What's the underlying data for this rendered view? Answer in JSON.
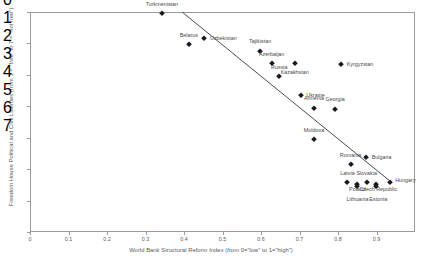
{
  "chart_data": {
    "type": "scatter",
    "title": "",
    "xlabel": "World Bank Structural Reform Index (from 0=\"low\" to 1=\"high\")",
    "ylabel": "Freedom House Political and Civil Liberties (from 1 = \"free\" to 7 = \"not free\")",
    "xlim": [
      0,
      1
    ],
    "ylim": [
      0,
      7
    ],
    "y_inverted": false,
    "grid": false,
    "legend": null,
    "xticks": [
      "0",
      "0.1",
      "0.2",
      "0.3",
      "0.4",
      "0.5",
      "0.6",
      "0.7",
      "0.8",
      "0.9"
    ],
    "yticks": [
      "0",
      "1",
      "2",
      "3",
      "4",
      "5",
      "6",
      "7"
    ],
    "points": [
      {
        "label": "Turkmenistan",
        "x": 0.34,
        "y": 7.0,
        "lx": 0.34,
        "ly": 7.3,
        "anchor": "mid"
      },
      {
        "label": "Uzbekistan",
        "x": 0.45,
        "y": 6.2,
        "lx": 0.465,
        "ly": 6.2,
        "anchor": "rgt"
      },
      {
        "label": "Belarus",
        "x": 0.41,
        "y": 6.0,
        "lx": 0.41,
        "ly": 6.3,
        "anchor": "mid"
      },
      {
        "label": "Tajikistan",
        "x": 0.595,
        "y": 5.8,
        "lx": 0.595,
        "ly": 6.1,
        "anchor": "mid"
      },
      {
        "label": "Azerbaijan",
        "x": 0.625,
        "y": 5.4,
        "lx": 0.625,
        "ly": 5.7,
        "anchor": "mid"
      },
      {
        "label": "Kazakhstan",
        "x": 0.685,
        "y": 5.4,
        "lx": 0.685,
        "ly": 5.12,
        "anchor": "mid"
      },
      {
        "label": "Kyrgyzstan",
        "x": 0.805,
        "y": 5.38,
        "lx": 0.82,
        "ly": 5.38,
        "anchor": "rgt"
      },
      {
        "label": "Russia",
        "x": 0.645,
        "y": 4.98,
        "lx": 0.645,
        "ly": 5.28,
        "anchor": "mid"
      },
      {
        "label": "Ukraine",
        "x": 0.7,
        "y": 4.4,
        "lx": 0.715,
        "ly": 4.4,
        "anchor": "rgt"
      },
      {
        "label": "Armenia",
        "x": 0.735,
        "y": 3.98,
        "lx": 0.735,
        "ly": 4.28,
        "anchor": "mid"
      },
      {
        "label": "Georgia",
        "x": 0.79,
        "y": 3.96,
        "lx": 0.79,
        "ly": 4.26,
        "anchor": "mid"
      },
      {
        "label": "Moldova",
        "x": 0.735,
        "y": 2.98,
        "lx": 0.735,
        "ly": 3.28,
        "anchor": "mid"
      },
      {
        "label": "Bulgaria",
        "x": 0.87,
        "y": 2.42,
        "lx": 0.885,
        "ly": 2.42,
        "anchor": "rgt"
      },
      {
        "label": "Romania",
        "x": 0.83,
        "y": 2.18,
        "lx": 0.83,
        "ly": 2.48,
        "anchor": "mid"
      },
      {
        "label": "Latvia",
        "x": 0.822,
        "y": 1.62,
        "lx": 0.822,
        "ly": 1.92,
        "anchor": "mid"
      },
      {
        "label": "Slovakia",
        "x": 0.872,
        "y": 1.62,
        "lx": 0.872,
        "ly": 1.92,
        "anchor": "mid"
      },
      {
        "label": "Hungary",
        "x": 0.932,
        "y": 1.62,
        "lx": 0.946,
        "ly": 1.7,
        "anchor": "rgt"
      },
      {
        "label": "Poland",
        "x": 0.848,
        "y": 1.55,
        "lx": 0.848,
        "ly": 1.4,
        "anchor": "mid"
      },
      {
        "label": "Czech Republic",
        "x": 0.896,
        "y": 1.55,
        "lx": 0.902,
        "ly": 1.4,
        "anchor": "mid"
      },
      {
        "label": "Lithuania",
        "x": 0.848,
        "y": 1.5,
        "lx": 0.848,
        "ly": 1.08,
        "anchor": "mid"
      },
      {
        "label": "Estonia",
        "x": 0.896,
        "y": 1.5,
        "lx": 0.902,
        "ly": 1.08,
        "anchor": "mid"
      }
    ],
    "trendline": {
      "x0": 0.395,
      "y0": 7.0,
      "x1": 0.935,
      "y1": 1.62
    },
    "colors": {
      "point": "#1a1a1a",
      "label": "#4a4a4c",
      "axis": "#9a9a9a",
      "trend": "#4d4d4d"
    }
  }
}
